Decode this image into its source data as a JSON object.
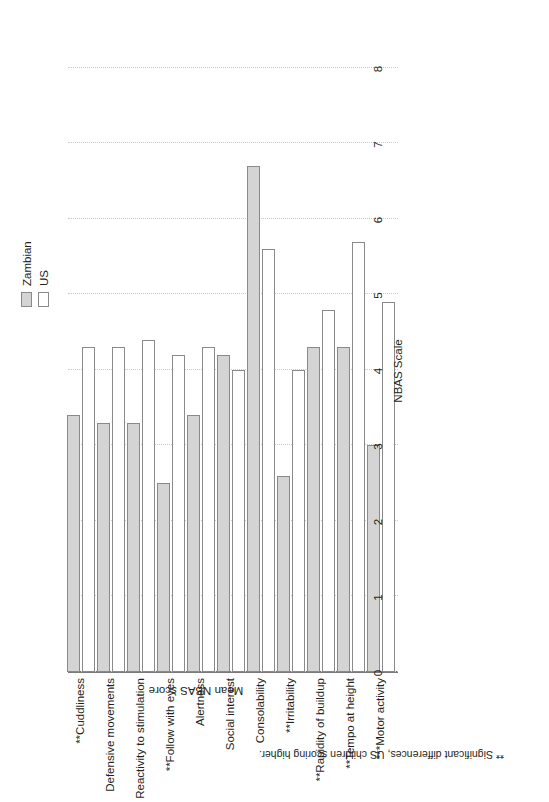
{
  "chart_data": {
    "type": "bar",
    "orientation": "horizontal",
    "title": "",
    "xlabel": "NBAS Scale",
    "ylabel": "Mean NBAS score",
    "ylim": [
      0,
      8
    ],
    "ticks": [
      "0",
      "1",
      "2",
      "3",
      "4",
      "5",
      "6",
      "7",
      "8"
    ],
    "grid": true,
    "legend_position": "top-right",
    "categories": [
      "**Cuddliness",
      "Defensive movements",
      "Reactivity to stimulation",
      "**Follow with eyes",
      "Alertness",
      "Social interest",
      "Consolability",
      "**Irritability",
      "**Rapidity of buildup",
      "**Tempo at height",
      "***Motor activity"
    ],
    "series": [
      {
        "name": "Zambian",
        "color": "#d4d4d4",
        "values": [
          3.4,
          3.3,
          3.3,
          2.5,
          3.4,
          4.2,
          6.7,
          2.6,
          4.3,
          4.3,
          3.0
        ]
      },
      {
        "name": "US",
        "color": "#ffffff",
        "values": [
          4.3,
          4.3,
          4.4,
          4.2,
          4.3,
          4.0,
          5.6,
          4.0,
          4.8,
          5.7,
          4.9
        ]
      }
    ],
    "footnote": "** Significant differences, US children scoring higher."
  },
  "legend": {
    "items": [
      {
        "label": "Zambian",
        "swatch": "zambian"
      },
      {
        "label": "US",
        "swatch": "us"
      }
    ]
  }
}
